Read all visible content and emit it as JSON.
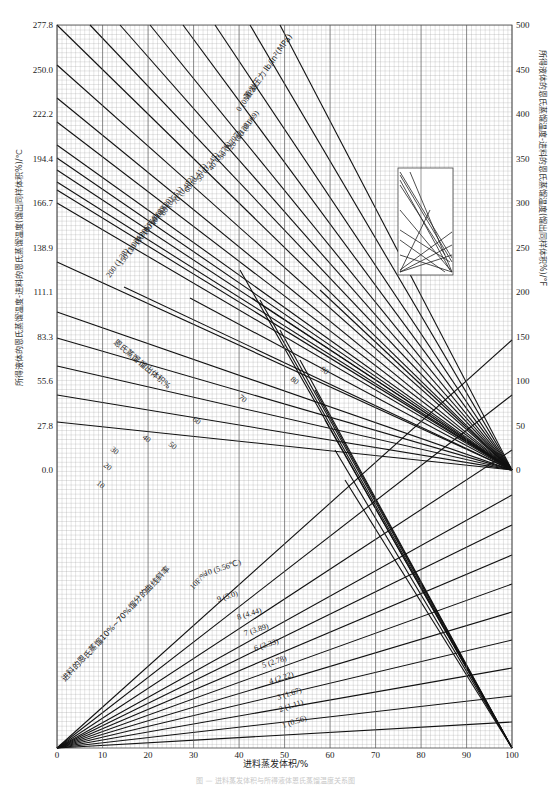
{
  "chart_data": {
    "type": "line",
    "title": "",
    "xlabel": "进料蒸发体积/%",
    "ylabel_left": "所得液体的恩氏蒸馏温度-进料的恩氏蒸馏温度(馏出同样体积%)/℃",
    "ylabel_right": "所得液体的恩氏蒸馏温度-进料的恩氏蒸馏温度(馏出同样体积%)/°F",
    "x_ticks": [
      "0",
      "10",
      "20",
      "30",
      "40",
      "50",
      "60",
      "70",
      "80",
      "90",
      "100"
    ],
    "xlim": [
      0,
      100
    ],
    "y_left_ticks": [
      "277.8",
      "250.0",
      "222.2",
      "194.4",
      "166.7",
      "138.9",
      "111.1",
      "83.3",
      "55.6",
      "27.8",
      "0.0"
    ],
    "y_right_ticks": [
      "500",
      "450",
      "400",
      "350",
      "300",
      "250",
      "200",
      "150",
      "100",
      "50",
      "0"
    ],
    "grid": true,
    "pressure_group": {
      "label": "蒸发压力 lb/in²(MPa)",
      "series": [
        {
          "name": "0 (0MPa)",
          "psi": "0",
          "mpa": "(0MPa)"
        },
        {
          "name": "10 (0.069)",
          "psi": "10",
          "mpa": "(0.069)"
        },
        {
          "name": "20 (0.138)",
          "psi": "20",
          "mpa": "(0.138)"
        },
        {
          "name": "30 (0.207)",
          "psi": "30",
          "mpa": "(0.207)"
        },
        {
          "name": "40 (0.276)",
          "psi": "40",
          "mpa": "(0.276)"
        },
        {
          "name": "50 (0.345)",
          "psi": "50",
          "mpa": "(0.345)"
        },
        {
          "name": "60 (0.413)",
          "psi": "60",
          "mpa": "(0.413)"
        },
        {
          "name": "70 (0.482)",
          "psi": "70",
          "mpa": "(0.482)"
        },
        {
          "name": "80 (0.551)",
          "psi": "80",
          "mpa": "(0.551)"
        },
        {
          "name": "90 (0.620)",
          "psi": "90",
          "mpa": "(0.620)"
        },
        {
          "name": "100 (0.689)",
          "psi": "100",
          "mpa": "(0.689)"
        },
        {
          "name": "110 (0.758)",
          "psi": "110",
          "mpa": "(0.758)"
        },
        {
          "name": "130 (0.896)",
          "psi": "130",
          "mpa": "(0.896)"
        },
        {
          "name": "150 (1.034)",
          "psi": "150",
          "mpa": "(1.034)"
        },
        {
          "name": "200 (1.38)",
          "psi": "200",
          "mpa": "(1.38)"
        }
      ]
    },
    "astm_group": {
      "label": "恩氏蒸馏馏出体积%",
      "series": [
        "10",
        "20",
        "30",
        "40",
        "50",
        "60",
        "70",
        "80",
        "90"
      ]
    },
    "slope_group": {
      "label": "进料的恩氏蒸馏10%~70%馏分的曲线斜率",
      "unit_label": "(5.56℃)",
      "unit_label2": "10F/%",
      "series": [
        {
          "name": "1 (0.56)",
          "f": "1",
          "c": "(0.56)"
        },
        {
          "name": "2 (1.11)",
          "f": "2",
          "c": "(1.11)"
        },
        {
          "name": "3 (1.67)",
          "f": "3",
          "c": "(1.67)"
        },
        {
          "name": "4 (2.22)",
          "f": "4",
          "c": "(2.22)"
        },
        {
          "name": "5 (2.78)",
          "f": "5",
          "c": "(2.78)"
        },
        {
          "name": "6 (3.33)",
          "f": "6",
          "c": "(3.33)"
        },
        {
          "name": "7 (3.89)",
          "f": "7",
          "c": "(3.89)"
        },
        {
          "name": "8 (4.44)",
          "f": "8",
          "c": "(4.44)"
        },
        {
          "name": "9 (5.0)",
          "f": "9",
          "c": "(5.0)"
        },
        {
          "name": "10 (5.56)",
          "f": "10",
          "c": "(5.56℃)"
        }
      ]
    }
  },
  "caption": "图 — 进料蒸发体积与所得液体恩氏蒸馏温度关系图"
}
